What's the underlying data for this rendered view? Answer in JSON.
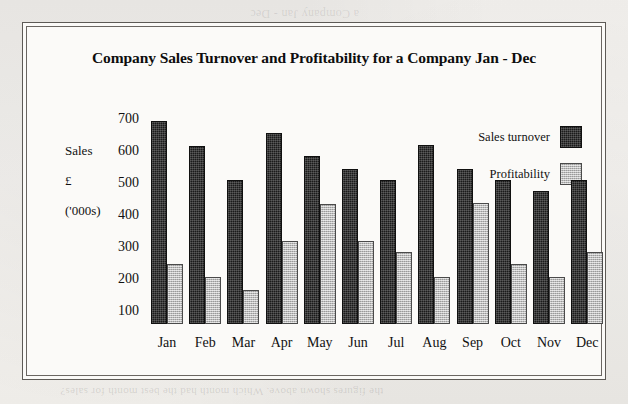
{
  "page": {
    "background_color": "#f2f0ec",
    "frame_color": "#5d5a56"
  },
  "bleed_through": {
    "line1": "Sales of a",
    "line2": "Company",
    "line3": "Sales",
    "top_strip": "a Company Jan - Dec",
    "bottom_strip": "the figures shown above. Which month had the best month for sales?"
  },
  "chart_data": {
    "type": "bar",
    "title": "Company Sales Turnover and Profitability for a Company Jan - Dec",
    "xlabel": "",
    "ylabel": "Sales\n£\n('000s)",
    "ylabel_lines": [
      "Sales",
      "£",
      "('000s)"
    ],
    "categories": [
      "Jan",
      "Feb",
      "Mar",
      "Apr",
      "May",
      "Jun",
      "Jul",
      "Aug",
      "Sep",
      "Oct",
      "Nov",
      "Dec"
    ],
    "yticks": [
      700,
      600,
      500,
      400,
      300,
      200,
      100
    ],
    "ylim": [
      60,
      720
    ],
    "grid": false,
    "legend_position": "top-right",
    "series": [
      {
        "name": "Sales turnover",
        "color": "#1b1b1b",
        "values": [
          695,
          615,
          508,
          655,
          585,
          545,
          508,
          618,
          545,
          508,
          475,
          508
        ]
      },
      {
        "name": "Profitability",
        "color": "#b6b6b6",
        "values": [
          248,
          205,
          165,
          320,
          435,
          320,
          283,
          205,
          438,
          248,
          205,
          285
        ]
      }
    ]
  }
}
